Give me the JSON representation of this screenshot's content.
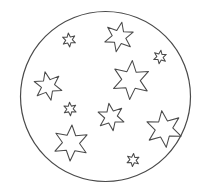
{
  "artwork": {
    "title": "Stars Inside a Circle",
    "style": "black outline line art / coloring page",
    "background_color": "#ffffff",
    "stroke_color": "#4a4a4a",
    "fill_color": "none",
    "canvas": {
      "width": 203,
      "height": 194
    }
  },
  "circle": {
    "name": "outer circle",
    "cx": 105.5,
    "cy": 96.5,
    "r": 85,
    "stroke_color": "#4a4a4a",
    "stroke_width": 1.2
  },
  "stars": [
    {
      "id": "star-small-upper-left",
      "label": "small star upper left",
      "size": "small",
      "points": 6,
      "cx": 69,
      "cy": 40,
      "outer_r": 7.0,
      "inner_r": 3.3,
      "rotation": -6
    },
    {
      "id": "star-medium-top",
      "label": "medium star top",
      "size": "medium",
      "points": 6,
      "cx": 119,
      "cy": 37,
      "outer_r": 15.0,
      "inner_r": 6.9,
      "rotation": 11
    },
    {
      "id": "star-small-right",
      "label": "small star right",
      "size": "small",
      "points": 6,
      "cx": 160,
      "cy": 57,
      "outer_r": 6.8,
      "inner_r": 3.2,
      "rotation": 8
    },
    {
      "id": "star-medium-left",
      "label": "medium star left",
      "size": "medium",
      "points": 6,
      "cx": 48,
      "cy": 86,
      "outer_r": 14.5,
      "inner_r": 6.7,
      "rotation": -12
    },
    {
      "id": "star-large-center-right",
      "label": "large star center right",
      "size": "large",
      "points": 6,
      "cx": 131,
      "cy": 80,
      "outer_r": 19.5,
      "inner_r": 9.3,
      "rotation": 4
    },
    {
      "id": "star-small-center-left",
      "label": "small star center left",
      "size": "small",
      "points": 6,
      "cx": 70,
      "cy": 109,
      "outer_r": 6.8,
      "inner_r": 3.2,
      "rotation": -4
    },
    {
      "id": "star-medium-center",
      "label": "medium star center bottom",
      "size": "medium",
      "points": 6,
      "cx": 111,
      "cy": 117,
      "outer_r": 13.8,
      "inner_r": 6.4,
      "rotation": -9
    },
    {
      "id": "star-large-lower-right",
      "label": "large star lower right",
      "size": "large",
      "points": 6,
      "cx": 164,
      "cy": 129,
      "outer_r": 18.5,
      "inner_r": 8.8,
      "rotation": -7
    },
    {
      "id": "star-large-lower-left",
      "label": "large star lower left",
      "size": "large",
      "points": 6,
      "cx": 71,
      "cy": 143,
      "outer_r": 18.0,
      "inner_r": 8.6,
      "rotation": 3
    },
    {
      "id": "star-small-bottom",
      "label": "small star bottom",
      "size": "small",
      "points": 6,
      "cx": 133,
      "cy": 160,
      "outer_r": 6.6,
      "inner_r": 3.1,
      "rotation": 5
    }
  ],
  "summary": {
    "star_count": 10,
    "small_count": 4,
    "medium_count": 3,
    "large_count": 3,
    "shape_count": 11
  }
}
